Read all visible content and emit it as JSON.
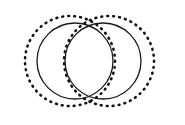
{
  "figure": {
    "canvas": {
      "width": 185,
      "height": 125,
      "background_color": "#ffffff"
    },
    "stroke_colors": {
      "solid": "#1a1a1a",
      "dotted": "#111111"
    },
    "circles": [
      {
        "id": "left-dotted-circle",
        "name": "left-dotted-circle",
        "style": "dotted",
        "cx": 70,
        "cy": 61,
        "r": 45,
        "stroke_width": 2.6,
        "dash_pattern": "0.8 5.2",
        "color": "#111111"
      },
      {
        "id": "right-dotted-circle",
        "name": "right-dotted-circle",
        "style": "dotted",
        "cx": 109,
        "cy": 61,
        "r": 45,
        "stroke_width": 2.6,
        "dash_pattern": "0.8 5.2",
        "color": "#111111"
      },
      {
        "id": "left-solid-circle",
        "name": "left-solid-circle",
        "style": "solid",
        "cx": 75,
        "cy": 61,
        "r": 38,
        "stroke_width": 1.3,
        "dash_pattern": "none",
        "color": "#1a1a1a"
      },
      {
        "id": "right-solid-circle",
        "name": "right-solid-circle",
        "style": "solid",
        "cx": 103,
        "cy": 61,
        "r": 38,
        "stroke_width": 1.3,
        "dash_pattern": "none",
        "color": "#1a1a1a"
      }
    ]
  }
}
